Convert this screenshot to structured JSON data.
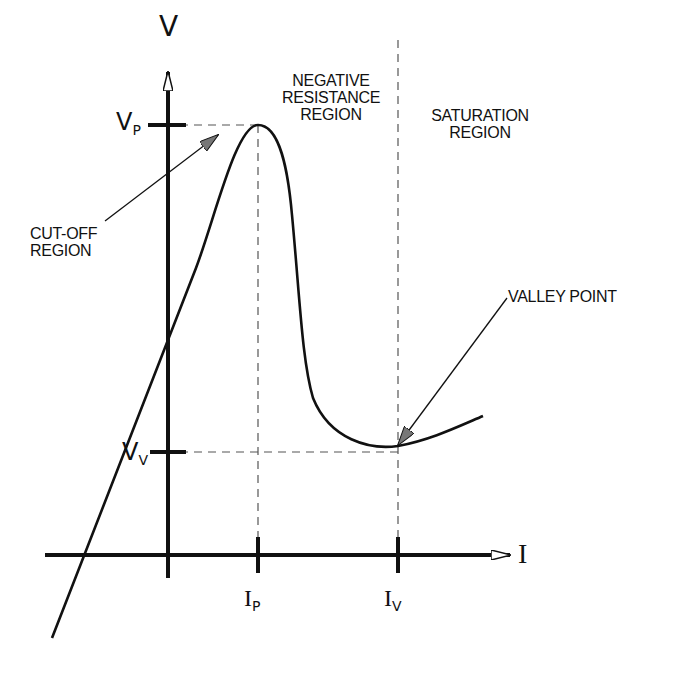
{
  "diagram": {
    "axes": {
      "y_label": "V",
      "x_label": "I"
    },
    "ticks": {
      "vp": {
        "main": "V",
        "sub": "P"
      },
      "vv": {
        "main": "V",
        "sub": "V"
      },
      "ip": {
        "main": "I",
        "sub": "P"
      },
      "iv": {
        "main": "I",
        "sub": "V"
      }
    },
    "regions": {
      "negative_resistance": [
        "NEGATIVE",
        "RESISTANCE",
        "REGION"
      ],
      "saturation": [
        "SATURATION",
        "REGION"
      ],
      "cutoff": [
        "CUT-OFF",
        "REGION"
      ]
    },
    "annotations": {
      "valley_point": "VALLEY POINT"
    },
    "colors": {
      "ink": "#111111",
      "background": "#ffffff",
      "dash": "#555555"
    }
  }
}
